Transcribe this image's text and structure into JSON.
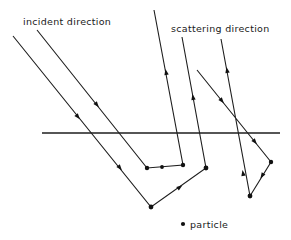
{
  "diagram": {
    "labels": {
      "incident": "incident direction",
      "scattering": "scattering direction",
      "legend_particle": "particle"
    },
    "colors": {
      "line": "#1e1e1e",
      "background": "#ffffff"
    },
    "surface": {
      "x1": 42,
      "y1": 133,
      "x2": 280,
      "y2": 133
    },
    "paths": [
      {
        "name": "path-1",
        "points": [
          [
            37,
            30
          ],
          [
            147,
            168
          ],
          [
            183,
            165
          ],
          [
            154,
            10
          ]
        ],
        "particles": [
          [
            147,
            168
          ],
          [
            162,
            167
          ],
          [
            183,
            165
          ]
        ]
      },
      {
        "name": "path-2",
        "points": [
          [
            13,
            36
          ],
          [
            151,
            207
          ],
          [
            206,
            168
          ],
          [
            182,
            37
          ]
        ],
        "particles": [
          [
            151,
            207
          ],
          [
            206,
            168
          ]
        ]
      },
      {
        "name": "path-3",
        "points": [
          [
            197,
            70
          ],
          [
            271,
            162
          ],
          [
            250,
            196
          ],
          [
            221,
            39
          ]
        ],
        "particles": [
          [
            271,
            162
          ],
          [
            250,
            196
          ]
        ]
      }
    ],
    "legend": {
      "symbol": "dot",
      "text": "particle"
    }
  }
}
